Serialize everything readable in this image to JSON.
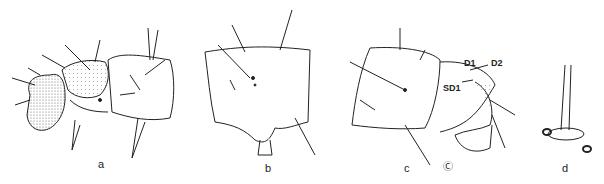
{
  "figure": {
    "panels": [
      {
        "id": "a",
        "label": "a",
        "description": "larva head and thoracic segments, lateral view"
      },
      {
        "id": "b",
        "label": "b",
        "description": "abdominal segment, lateral view"
      },
      {
        "id": "c",
        "label": "c",
        "description": "terminal abdominal segments, lateral view"
      },
      {
        "id": "d",
        "label": "d",
        "description": "seta base detail"
      }
    ],
    "annotations": {
      "d1": "D1",
      "d2": "D2",
      "sd1": "SD1",
      "extra": "Ⓒ"
    },
    "colors": {
      "ink": "#222222",
      "stipple": "#888888",
      "background": "#ffffff"
    }
  }
}
